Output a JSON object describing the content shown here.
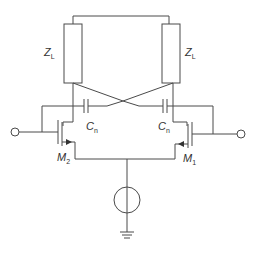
{
  "diagram": {
    "colors": {
      "wire": "#4a4a4a",
      "text": "#333333",
      "background": "#ffffff"
    },
    "labels": {
      "zl_left": {
        "main": "Z",
        "sub": "L"
      },
      "zl_right": {
        "main": "Z",
        "sub": "L"
      },
      "cn_left": {
        "main": "C",
        "sub": "n"
      },
      "cn_right": {
        "main": "C",
        "sub": "n"
      },
      "m2": {
        "main": "M",
        "sub": "2"
      },
      "m1": {
        "main": "M",
        "sub": "1"
      }
    },
    "components": [
      {
        "id": "ZL-left",
        "type": "impedance"
      },
      {
        "id": "ZL-right",
        "type": "impedance"
      },
      {
        "id": "Cn-left",
        "type": "capacitor"
      },
      {
        "id": "Cn-right",
        "type": "capacitor"
      },
      {
        "id": "M2",
        "type": "nmos-transistor"
      },
      {
        "id": "M1",
        "type": "nmos-transistor"
      },
      {
        "id": "I-tail",
        "type": "current-source"
      },
      {
        "id": "GND",
        "type": "ground"
      },
      {
        "id": "in-left",
        "type": "terminal"
      },
      {
        "id": "in-right",
        "type": "terminal"
      }
    ]
  }
}
